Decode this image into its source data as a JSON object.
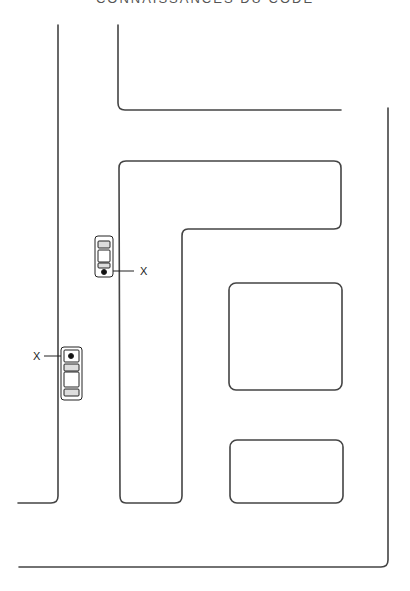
{
  "header": {
    "title": "CONNAISSANCES DU CODE"
  },
  "diagram": {
    "type": "street-map",
    "stroke_color": "#444444",
    "background": "#ffffff",
    "markers": [
      {
        "label": "X",
        "target": "car-parked-right-side"
      },
      {
        "label": "X",
        "target": "car-parked-left-side"
      }
    ]
  }
}
